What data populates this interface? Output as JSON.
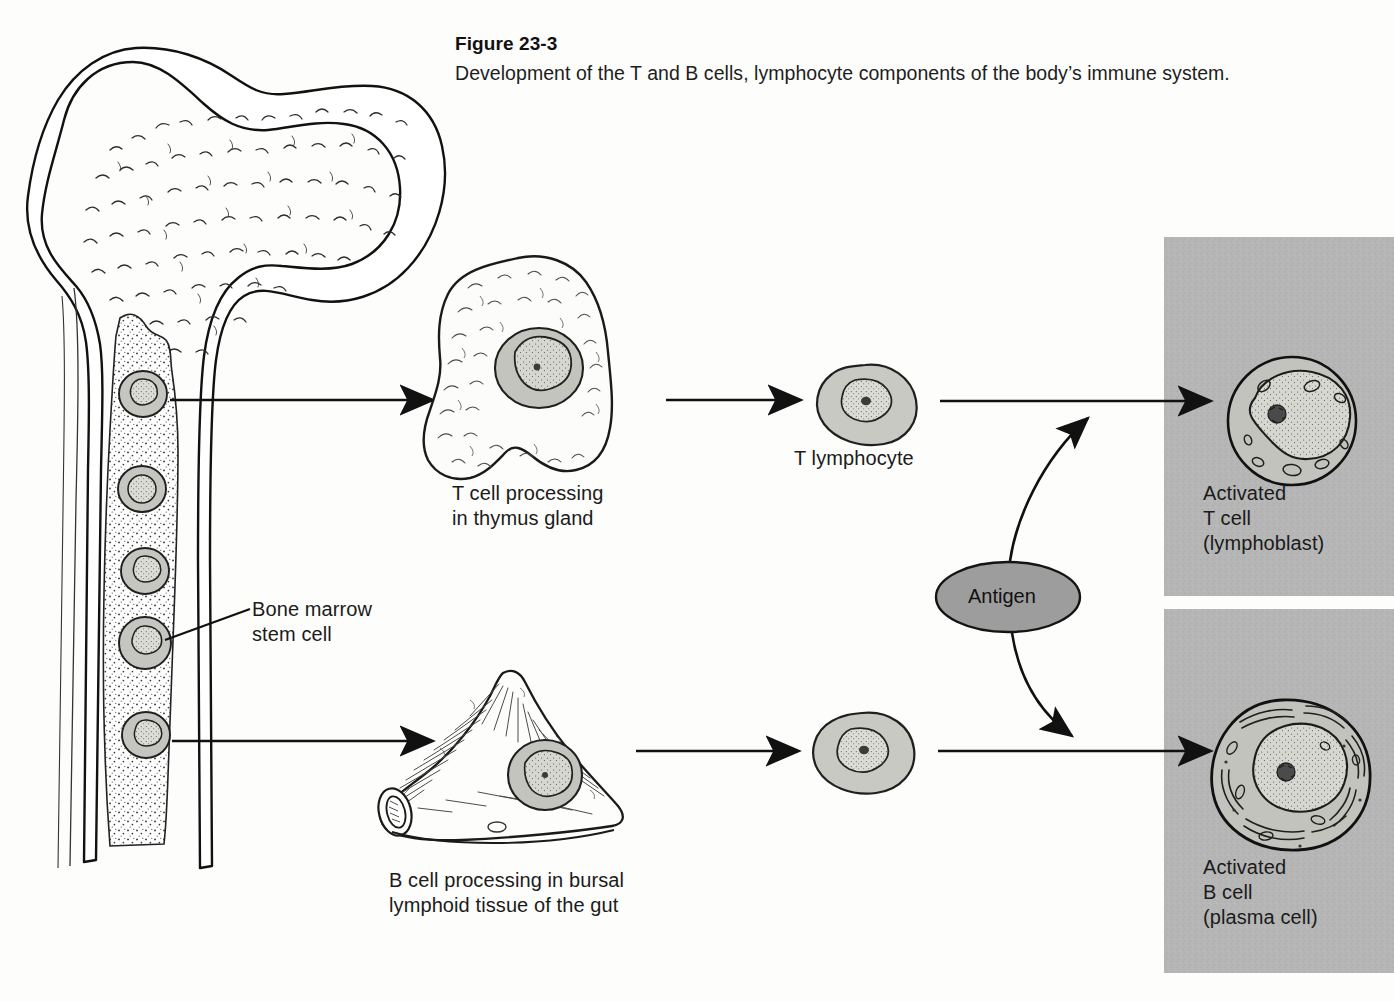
{
  "figure": {
    "number": "Figure 23-3",
    "caption": "Development of the T and B cells, lymphocyte components of the body’s immune system."
  },
  "labels": {
    "bone_marrow_stem_cell": "Bone marrow\nstem cell",
    "t_cell_processing": "T cell processing\nin thymus gland",
    "t_lymphocyte": "T lymphocyte",
    "b_cell_processing": "B cell processing in bursal\nlymphoid tissue of the gut",
    "antigen": "Antigen",
    "activated_t_cell": "Activated\nT cell\n(lymphoblast)",
    "activated_b_cell": "Activated\nB cell\n(plasma cell)"
  },
  "colors": {
    "page_background": "#fdfdfc",
    "ink": "#1a1a1a",
    "panel_gray": "#b4b4b4",
    "cell_cytoplasm": "#c9c9c4",
    "cell_nucleus": "#d8d8d2",
    "antigen_fill": "#9a9a9a",
    "marrow_stipple": "#2a2a2a"
  },
  "structures": {
    "femur": "proximal femur with trabecular spongy bone and medullary cavity",
    "marrow_cavity": "stippled red-marrow column containing stem cells",
    "stem_cell_count": 5,
    "thymus": "bi-lobed thymus gland",
    "bursa": "bursal lymphoid tissue of the gut (cone with cut tube)",
    "t_pathway_panel": "upper gray panel — activated T cell",
    "b_pathway_panel": "lower gray panel — activated B cell"
  },
  "flow": {
    "top_arrows": [
      "marrow to thymus",
      "thymus to T lymphocyte",
      "T lymphocyte to activated T cell"
    ],
    "bottom_arrows": [
      "marrow to bursa",
      "bursa to B lymphocyte",
      "B lymphocyte to activated B cell"
    ],
    "antigen_arrows": [
      "antigen to T pathway (curved, upward)",
      "antigen to B pathway (curved, downward)"
    ]
  }
}
